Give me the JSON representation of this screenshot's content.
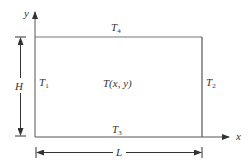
{
  "diagram": {
    "type": "rectangular-plate-boundary-temperatures",
    "axes": {
      "x_label": "x",
      "y_label": "y"
    },
    "boundaries": {
      "left": {
        "symbol": "T",
        "sub": "1"
      },
      "right": {
        "symbol": "T",
        "sub": "2"
      },
      "bottom": {
        "symbol": "T",
        "sub": "3"
      },
      "top": {
        "symbol": "T",
        "sub": "4"
      }
    },
    "interior_label": "T(x, y)",
    "dimensions": {
      "height": "H",
      "length": "L"
    },
    "colors": {
      "line": "#555555",
      "text": "#333333",
      "background": "#ffffff"
    }
  }
}
